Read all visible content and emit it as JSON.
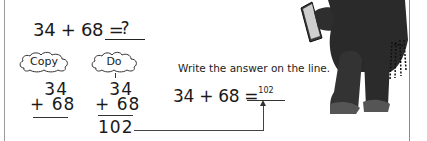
{
  "problem": {
    "equation": "34 + 68 =",
    "blank_placeholder": "?"
  },
  "clouds": {
    "copy_label": "Copy",
    "do_label": "Do"
  },
  "copy_column": {
    "top": "34",
    "bottom": "+ 68"
  },
  "do_column": {
    "top": "34",
    "bottom": "+ 68",
    "answer": "102"
  },
  "instruction": "Write the answer on the line.",
  "answer_equation": {
    "equation": "34 + 68 =",
    "answer": "102"
  },
  "illustration": {
    "icon": "teddy-bear-with-book-icon"
  }
}
